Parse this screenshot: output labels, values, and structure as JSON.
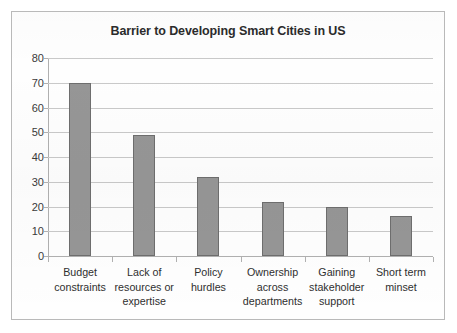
{
  "chart_data": {
    "type": "bar",
    "title": "Barrier to Developing Smart Cities in US",
    "xlabel": "",
    "ylabel": "",
    "categories": [
      "Budget constraints",
      "Lack of resources or expertise",
      "Policy hurdles",
      "Ownership across departments",
      "Gaining stakeholder support",
      "Short term minset"
    ],
    "values": [
      70,
      49,
      32,
      22,
      20,
      16
    ],
    "ylim": [
      0,
      80
    ],
    "ytick_labels": [
      "0",
      "10",
      "20",
      "30",
      "40",
      "50",
      "60",
      "70",
      "80"
    ],
    "ytick_values": [
      0,
      10,
      20,
      30,
      40,
      50,
      60,
      70,
      80
    ],
    "grid": true,
    "legend": false,
    "legend_position": "none",
    "bar_color": "#969696",
    "bar_border_color": "#6e6e6e",
    "gridline_color": "#c9c9c9",
    "axis_color": "#b0b0b0",
    "title_color": "#2b2b2b",
    "background_color": "#fefefe",
    "border_color": "#b9b9b9"
  }
}
